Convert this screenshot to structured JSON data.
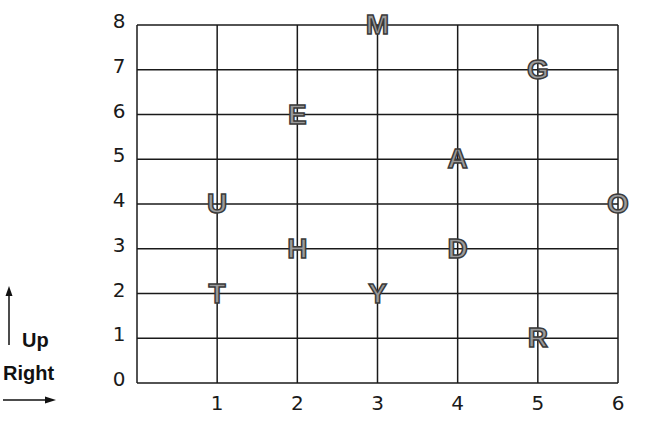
{
  "chart_data": {
    "type": "scatter",
    "title": "",
    "xlabel": "",
    "ylabel": "",
    "xlim": [
      0,
      6
    ],
    "ylim": [
      0,
      8
    ],
    "grid": true,
    "x_ticks": [
      "",
      "1",
      "2",
      "3",
      "4",
      "5",
      "6"
    ],
    "y_ticks": [
      "0",
      "1",
      "2",
      "3",
      "4",
      "5",
      "6",
      "7",
      "8"
    ],
    "points": [
      {
        "label": "M",
        "x": 3,
        "y": 8
      },
      {
        "label": "G",
        "x": 5,
        "y": 7
      },
      {
        "label": "E",
        "x": 2,
        "y": 6
      },
      {
        "label": "A",
        "x": 4,
        "y": 5
      },
      {
        "label": "U",
        "x": 1,
        "y": 4
      },
      {
        "label": "O",
        "x": 6,
        "y": 4
      },
      {
        "label": "H",
        "x": 2,
        "y": 3
      },
      {
        "label": "D",
        "x": 4,
        "y": 3
      },
      {
        "label": "T",
        "x": 1,
        "y": 2
      },
      {
        "label": "Y",
        "x": 3,
        "y": 2
      },
      {
        "label": "R",
        "x": 5,
        "y": 1
      }
    ],
    "legend": {
      "up_label": "Up",
      "right_label": "Right"
    }
  },
  "style": {
    "line_color": "#1a1a1a",
    "letter_fill": "#9a9a9a",
    "letter_stroke": "#3a3a3a"
  }
}
